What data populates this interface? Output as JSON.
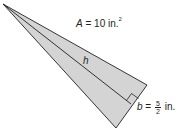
{
  "figure": {
    "type": "triangle-with-altitude",
    "fill_color": "#d4d4d4",
    "stroke_color": "#231f20",
    "vertices": {
      "apex": [
        3,
        4
      ],
      "base_right": [
        147,
        85
      ],
      "base_bottom": [
        116,
        128
      ]
    },
    "altitude_foot": [
      131,
      104
    ],
    "area_label": {
      "var": "A",
      "eq": " = 10 in.",
      "exp": "2"
    },
    "height_label": "h",
    "base_label": {
      "var": "b",
      "eq": " = ",
      "num": "5",
      "den": "2",
      "unit": " in."
    }
  }
}
